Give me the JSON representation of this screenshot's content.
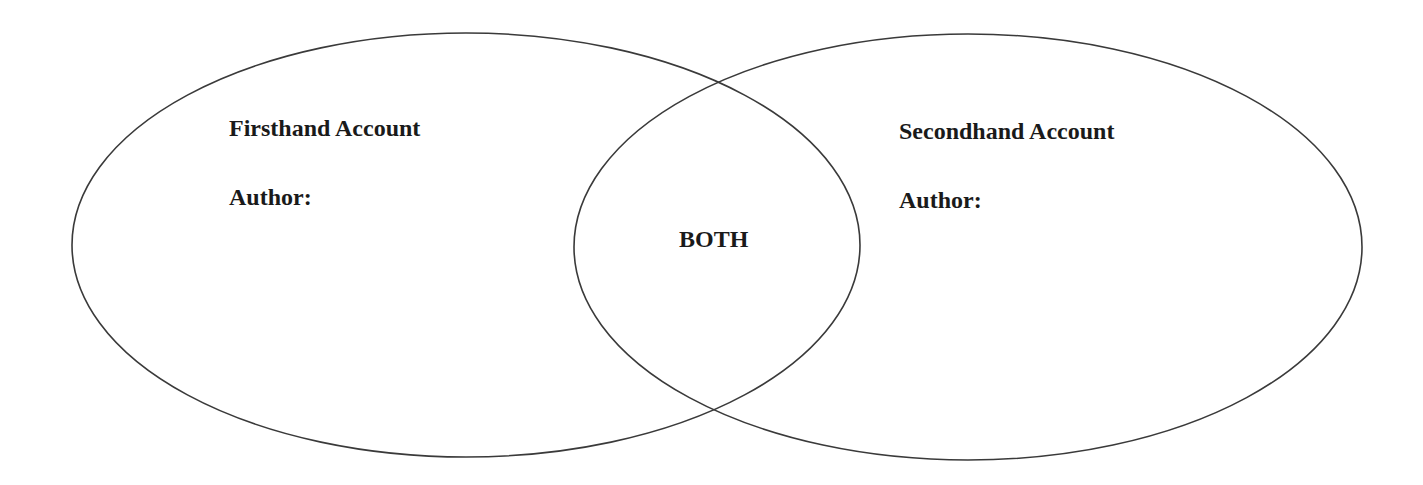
{
  "diagram": {
    "type": "venn",
    "stroke_color": "#3a3a3a",
    "background": "#ffffff",
    "left_circle": {
      "title": "Firsthand Account",
      "author_label": "Author:"
    },
    "overlap": {
      "label": "BOTH"
    },
    "right_circle": {
      "title": "Secondhand Account",
      "author_label": "Author:"
    }
  }
}
